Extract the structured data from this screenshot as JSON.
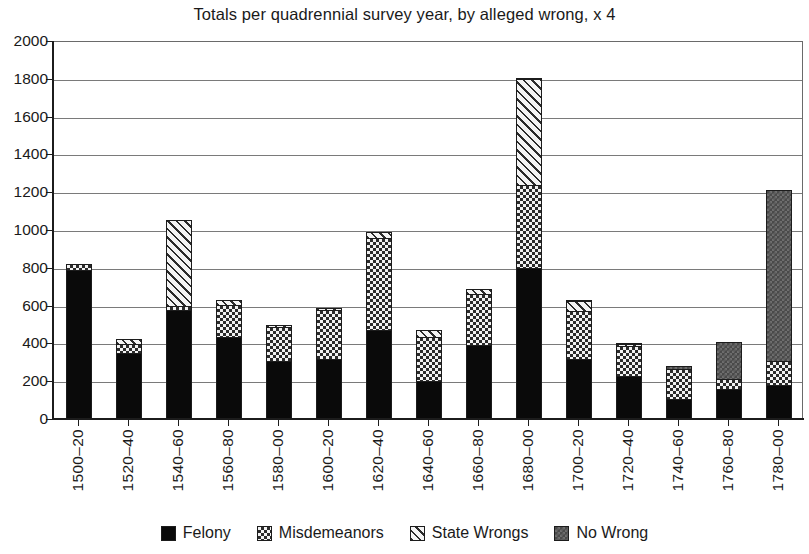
{
  "chart_data": {
    "type": "bar",
    "subtype": "stacked",
    "title": "Totals per quadrennial survey year, by alleged wrong, x 4",
    "xlabel": "",
    "ylabel": "",
    "ylim": [
      0,
      2000
    ],
    "ytick_step": 200,
    "yticks": [
      2000,
      1800,
      1600,
      1400,
      1200,
      1000,
      800,
      600,
      400,
      200,
      0
    ],
    "grid": true,
    "legend_position": "bottom",
    "categories": [
      "1500–20",
      "1520–40",
      "1540–60",
      "1560–80",
      "1580–00",
      "1600–20",
      "1620–40",
      "1640–60",
      "1660–80",
      "1680–00",
      "1700–20",
      "1720–40",
      "1740–60",
      "1760–80",
      "1780–00"
    ],
    "series": [
      {
        "name": "Felony",
        "key": "felony",
        "color": "#0a0a0a",
        "pattern": "solid-black",
        "values": [
          790,
          350,
          575,
          435,
          305,
          315,
          470,
          200,
          390,
          800,
          315,
          225,
          105,
          160,
          180
        ]
      },
      {
        "name": "Misdemeanors",
        "key": "misdemeanors",
        "color": "#f2f2f2",
        "pattern": "checkerboard",
        "values": [
          35,
          50,
          30,
          175,
          185,
          265,
          495,
          240,
          275,
          445,
          260,
          165,
          165,
          55,
          130
        ]
      },
      {
        "name": "State Wrongs",
        "key": "state_wrongs",
        "color": "#f4f4f4",
        "pattern": "diagonal-hatch",
        "values": [
          0,
          35,
          460,
          30,
          20,
          20,
          35,
          40,
          35,
          565,
          60,
          15,
          0,
          0,
          0
        ]
      },
      {
        "name": "No Wrong",
        "key": "no_wrong",
        "color": "#4a4a4a",
        "pattern": "dark-gray",
        "values": [
          0,
          0,
          0,
          0,
          0,
          0,
          0,
          0,
          0,
          10,
          10,
          15,
          20,
          205,
          915
        ]
      }
    ],
    "totals": [
      825,
      435,
      1065,
      640,
      510,
      600,
      1000,
      480,
      700,
      1820,
      645,
      420,
      290,
      420,
      1225
    ]
  }
}
